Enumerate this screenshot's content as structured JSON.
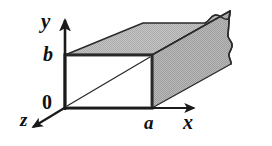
{
  "figure": {
    "kind": "rectangular-waveguide-3d-diagram",
    "background_color": "#ffffff"
  },
  "axes": {
    "y": {
      "label": "y",
      "direction": "up",
      "origin_px": [
        65,
        108
      ],
      "tip_px": [
        65,
        18
      ]
    },
    "x": {
      "label": "x",
      "direction": "right",
      "origin_px": [
        65,
        108
      ],
      "tip_px": [
        196,
        108
      ]
    },
    "z": {
      "label": "z",
      "direction": "down-left",
      "origin_px": [
        65,
        108
      ],
      "tip_px": [
        30,
        129
      ]
    },
    "labels": [
      {
        "id": "y-axis-label",
        "text": "y"
      },
      {
        "id": "x-axis-label",
        "text": "x"
      },
      {
        "id": "z-axis-label",
        "text": "z"
      }
    ]
  },
  "tick_labels": {
    "origin": "0",
    "height": "b",
    "width": "a"
  },
  "aperture": {
    "name": "waveguide-opening",
    "fill_color": "#ffffff",
    "stroke_color": "#2a2a2a",
    "rect_px": {
      "x": 65,
      "y": 55,
      "width": 87,
      "height": 53
    },
    "diagonal": {
      "from_px": [
        67,
        106
      ],
      "to_px": [
        150,
        57
      ]
    }
  },
  "body": {
    "name": "waveguide-body",
    "fill_color": "#bdbdbd",
    "stroke_color": "#2a2a2a",
    "depth_offset_px": [
      78,
      -44
    ],
    "torn_edge": true
  },
  "colors": {
    "ink": "#1a1a1a",
    "gray_fill": "#bdbdbd",
    "gray_fill_dark": "#ababab",
    "white_fill": "#ffffff",
    "outline": "#2a2a2a"
  }
}
